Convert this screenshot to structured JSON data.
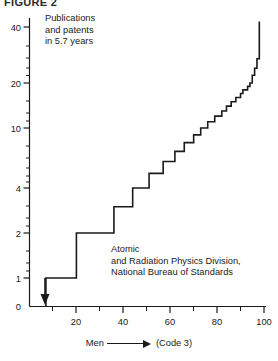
{
  "figure": {
    "label": "FIGURE 2"
  },
  "annotations": {
    "top_left": "Publications\nand patents\nin 5.7 years",
    "middle": "Atomic\nand Radiation Physics Division,\nNational Bureau of Standards"
  },
  "xaxis_caption": {
    "prefix": "Men",
    "arrow": "arrow-right-icon",
    "suffix": "(Code 3)"
  },
  "colors": {
    "ink": "#1a1a1a",
    "background": "#ffffff"
  },
  "chart_data": {
    "type": "line",
    "title": "FIGURE 2",
    "subtitle": "Publications and patents in 5.7 years",
    "annotation": "Atomic and Radiation Physics Division, National Bureau of Standards",
    "xlabel": "Men —→ (Code 3)",
    "ylabel": "Publications and patents in 5.7 years",
    "xlim": [
      0,
      100
    ],
    "ylim": [
      0,
      45
    ],
    "yscale": "log-like",
    "grid": false,
    "legend": null,
    "x_ticks": [
      20,
      40,
      60,
      80,
      100
    ],
    "x_minor_ticks": [
      10,
      30,
      50,
      70,
      90
    ],
    "y_ticks": [
      0,
      1,
      2,
      4,
      10,
      20,
      40
    ],
    "step_interpolation": "post",
    "marker_arrow": {
      "x": 7,
      "y": 1,
      "direction": "down",
      "note": "drop to zero at left edge"
    },
    "x": [
      7,
      7,
      20,
      20,
      36,
      36,
      44,
      44,
      51,
      51,
      57,
      57,
      62,
      62,
      66,
      66,
      70,
      70,
      73,
      73,
      76,
      76,
      79,
      79,
      82,
      82,
      84,
      84,
      86,
      86,
      88,
      88,
      90,
      90,
      91,
      91,
      93,
      93,
      94,
      94,
      95,
      95,
      96,
      96,
      97,
      97,
      98,
      98
    ],
    "y": [
      0,
      1,
      1,
      2,
      2,
      3,
      3,
      4,
      4,
      5,
      5,
      6,
      6,
      7,
      7,
      8,
      8,
      9,
      9,
      10,
      10,
      11,
      11,
      12,
      12,
      13,
      13,
      14,
      14,
      15,
      15,
      16,
      16,
      17,
      17,
      18,
      18,
      19,
      19,
      20,
      20,
      22,
      22,
      24,
      24,
      27,
      27,
      43
    ],
    "series": [
      {
        "name": "Cumulative output per man",
        "points": [
          {
            "men_percent": 7,
            "publications": 1
          },
          {
            "men_percent": 20,
            "publications": 2
          },
          {
            "men_percent": 36,
            "publications": 3
          },
          {
            "men_percent": 44,
            "publications": 4
          },
          {
            "men_percent": 51,
            "publications": 5
          },
          {
            "men_percent": 57,
            "publications": 6
          },
          {
            "men_percent": 62,
            "publications": 7
          },
          {
            "men_percent": 66,
            "publications": 8
          },
          {
            "men_percent": 70,
            "publications": 9
          },
          {
            "men_percent": 73,
            "publications": 10
          },
          {
            "men_percent": 76,
            "publications": 11
          },
          {
            "men_percent": 79,
            "publications": 12
          },
          {
            "men_percent": 82,
            "publications": 13
          },
          {
            "men_percent": 84,
            "publications": 14
          },
          {
            "men_percent": 86,
            "publications": 15
          },
          {
            "men_percent": 88,
            "publications": 16
          },
          {
            "men_percent": 90,
            "publications": 17
          },
          {
            "men_percent": 91,
            "publications": 18
          },
          {
            "men_percent": 93,
            "publications": 19
          },
          {
            "men_percent": 94,
            "publications": 20
          },
          {
            "men_percent": 95,
            "publications": 22
          },
          {
            "men_percent": 96,
            "publications": 24
          },
          {
            "men_percent": 97,
            "publications": 27
          },
          {
            "men_percent": 98,
            "publications": 43
          }
        ]
      }
    ]
  }
}
